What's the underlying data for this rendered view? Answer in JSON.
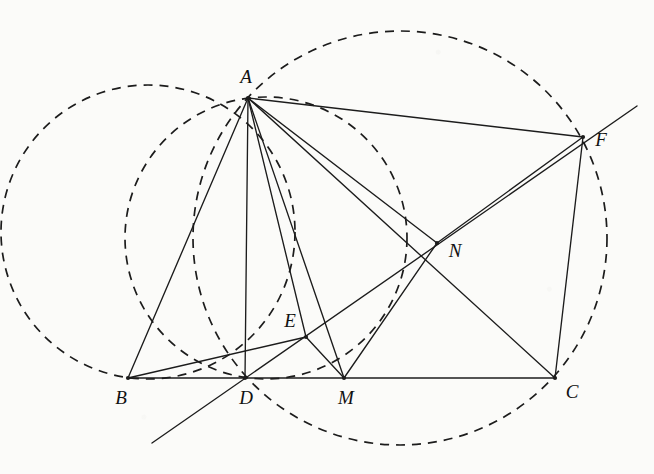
{
  "figure": {
    "background_color": "#fbfbf9",
    "ink_color": "#1c1c1c",
    "label_color": "#111111"
  },
  "points": [
    {
      "id": "A",
      "label": "A",
      "x": 248,
      "y": 98,
      "label_x": 246,
      "label_y": 79,
      "dot": true
    },
    {
      "id": "B",
      "label": "B",
      "x": 128,
      "y": 378,
      "label_x": 121,
      "label_y": 400,
      "dot": true
    },
    {
      "id": "C",
      "label": "C",
      "x": 555,
      "y": 378,
      "label_x": 572,
      "label_y": 394,
      "dot": true
    },
    {
      "id": "D",
      "label": "D",
      "x": 245,
      "y": 378,
      "label_x": 246,
      "label_y": 400,
      "dot": true
    },
    {
      "id": "E",
      "label": "E",
      "x": 306,
      "y": 337,
      "label_x": 290,
      "label_y": 323,
      "dot": true
    },
    {
      "id": "M",
      "label": "M",
      "x": 344,
      "y": 378,
      "label_x": 346,
      "label_y": 400,
      "dot": true
    },
    {
      "id": "N",
      "label": "N",
      "x": 437,
      "y": 243,
      "label_x": 455,
      "label_y": 253,
      "dot": true
    },
    {
      "id": "F",
      "label": "F",
      "x": 583,
      "y": 137,
      "label_x": 601,
      "label_y": 142,
      "dot": true
    }
  ],
  "segments": [
    {
      "name": "side-BC",
      "from": "B",
      "to": "C",
      "x1": 128,
      "y1": 378,
      "x2": 555,
      "y2": 378
    },
    {
      "name": "side-AB",
      "from": "A",
      "to": "B",
      "x1": 248,
      "y1": 98,
      "x2": 128,
      "y2": 378
    },
    {
      "name": "side-AC-via-F",
      "from": "A",
      "to": "F",
      "x1": 248,
      "y1": 98,
      "x2": 583,
      "y2": 137
    },
    {
      "name": "segment-FC",
      "from": "F",
      "to": "C",
      "x1": 583,
      "y1": 137,
      "x2": 555,
      "y2": 378
    },
    {
      "name": "cevian-AD",
      "from": "A",
      "to": "D",
      "x1": 248,
      "y1": 98,
      "x2": 245,
      "y2": 378
    },
    {
      "name": "cevian-AE-extended",
      "from": "A",
      "to": "E",
      "x1": 248,
      "y1": 98,
      "x2": 306,
      "y2": 337
    },
    {
      "name": "cevian-AM",
      "from": "A",
      "to": "M",
      "x1": 248,
      "y1": 98,
      "x2": 344,
      "y2": 378
    },
    {
      "name": "cevian-AC",
      "from": "A",
      "to": "C",
      "x1": 248,
      "y1": 98,
      "x2": 555,
      "y2": 378
    },
    {
      "name": "line-AN-to-C",
      "from": "A",
      "to": "N",
      "x1": 248,
      "y1": 98,
      "x2": 437,
      "y2": 243
    },
    {
      "name": "segment-BE",
      "from": "B",
      "to": "E",
      "x1": 128,
      "y1": 378,
      "x2": 306,
      "y2": 337
    },
    {
      "name": "segment-EM",
      "from": "E",
      "to": "M",
      "x1": 306,
      "y1": 337,
      "x2": 344,
      "y2": 378
    },
    {
      "name": "segment-MN",
      "from": "M",
      "to": "N",
      "x1": 344,
      "y1": 378,
      "x2": 437,
      "y2": 243
    },
    {
      "name": "segment-NF",
      "from": "N",
      "to": "F",
      "x1": 437,
      "y1": 243,
      "x2": 583,
      "y2": 137
    },
    {
      "name": "line-through-D-E-N",
      "from": "lower-left-ray",
      "to": "N-and-beyond",
      "x1": 152,
      "y1": 443,
      "x2": 637,
      "y2": 106
    }
  ],
  "circles": [
    {
      "name": "circumcircle-ABD",
      "cx": 148,
      "cy": 232,
      "r": 147,
      "style": "dashed"
    },
    {
      "name": "circumcircle-ADC",
      "cx": 400,
      "cy": 238,
      "r": 207,
      "style": "dashed"
    },
    {
      "name": "circumcircle-ADE",
      "cx": 266,
      "cy": 238,
      "r": 141,
      "style": "dashed"
    }
  ]
}
